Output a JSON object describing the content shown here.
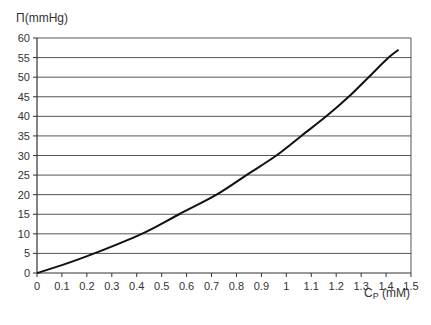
{
  "chart_data": {
    "type": "line",
    "title": "",
    "ylabel": "Π(mmHg)",
    "xlabel": "C",
    "xlabel_sub": "P",
    "xlabel_unit": " (mM)",
    "xlim": [
      0,
      1.5
    ],
    "ylim": [
      0,
      60
    ],
    "x_ticks": [
      0,
      0.1,
      0.2,
      0.3,
      0.4,
      0.5,
      0.6,
      0.7,
      0.8,
      0.9,
      1,
      1.1,
      1.2,
      1.3,
      1.4,
      1.5
    ],
    "y_ticks": [
      0,
      5,
      10,
      15,
      20,
      25,
      30,
      35,
      40,
      45,
      50,
      55,
      60
    ],
    "grid": "horizontal",
    "legend": null,
    "series": [
      {
        "name": "Π vs Cp",
        "x": [
          0,
          0.1,
          0.23,
          0.42,
          0.57,
          0.72,
          0.84,
          0.96,
          1.06,
          1.16,
          1.25,
          1.33,
          1.41,
          1.45
        ],
        "y": [
          0,
          2,
          5,
          10,
          15,
          20,
          25,
          30,
          35,
          40,
          45,
          50,
          55,
          57
        ]
      }
    ]
  }
}
